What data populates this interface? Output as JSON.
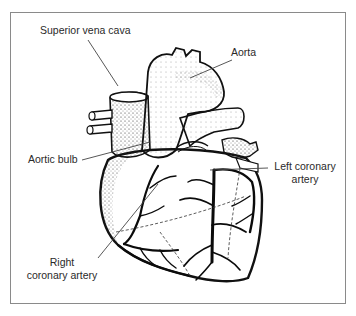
{
  "figure": {
    "labels": {
      "superior_vena_cava": "Superior vena cava",
      "aorta": "Aorta",
      "aortic_bulb": "Aortic bulb",
      "left_coronary_artery_line1": "Left coronary",
      "left_coronary_artery_line2": "artery",
      "right_coronary_artery_line1": "Right",
      "right_coronary_artery_line2": "coronary artery"
    }
  },
  "colors": {
    "ink": "#111111",
    "label_text": "#2a2a2a",
    "leader_line": "#444444",
    "frame_border": "#8a8a8a",
    "background": "#ffffff"
  }
}
